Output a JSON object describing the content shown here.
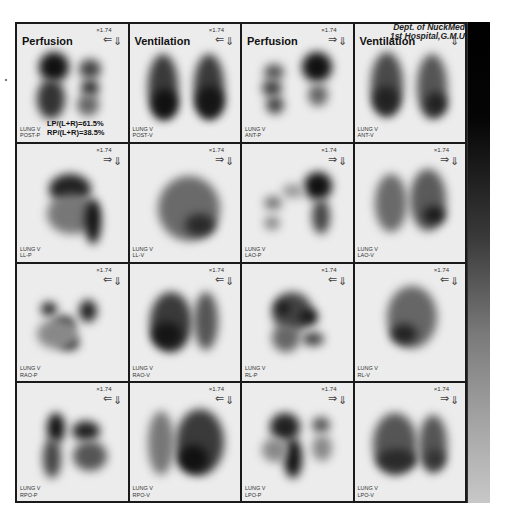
{
  "header": {
    "dept": "Dept. of NuckMed",
    "hospital": "1st Hospital,G.M.U"
  },
  "colorbar": {
    "top_color": "#000000",
    "bottom_color": "#c8c8c8"
  },
  "cells": [
    {
      "title": "Perfusion",
      "scale": "×1.74",
      "arrow_h": "⇐",
      "arrow_v": "⇓",
      "label_line1": "LUNG V",
      "label_line2": "POST-P",
      "ratio_lp": "LP/(L+R)=61.5%",
      "ratio_rp": "RP/(L+R)=38.5%"
    },
    {
      "title": "Ventilation",
      "scale": "×1.74",
      "arrow_h": "⇐",
      "arrow_v": "⇓",
      "label_line1": "LUNG V",
      "label_line2": "POST-V"
    },
    {
      "title": "Perfusion",
      "scale": "×1.74",
      "arrow_h": "⇒",
      "arrow_v": "⇓",
      "label_line1": "LUNG V",
      "label_line2": "ANT-P"
    },
    {
      "title": "Ventilation",
      "scale": "",
      "arrow_h": "",
      "arrow_v": "⇓",
      "label_line1": "LUNG V",
      "label_line2": "ANT-V"
    },
    {
      "scale": "×1.74",
      "arrow_h": "⇒",
      "arrow_v": "⇓",
      "label_line1": "LUNG V",
      "label_line2": "LL-P"
    },
    {
      "scale": "×1.74",
      "arrow_h": "⇒",
      "arrow_v": "⇓",
      "label_line1": "LUNG V",
      "label_line2": "LL-V"
    },
    {
      "scale": "×1.74",
      "arrow_h": "⇒",
      "arrow_v": "⇓",
      "label_line1": "LUNG V",
      "label_line2": "LAO-P"
    },
    {
      "scale": "×1.74",
      "arrow_h": "⇒",
      "arrow_v": "⇓",
      "label_line1": "LUNG V",
      "label_line2": "LAO-V"
    },
    {
      "scale": "×1.74",
      "arrow_h": "⇐",
      "arrow_v": "⇓",
      "label_line1": "LUNG V",
      "label_line2": "RAO-P"
    },
    {
      "scale": "×1.74",
      "arrow_h": "⇐",
      "arrow_v": "⇓",
      "label_line1": "LUNG V",
      "label_line2": "RAO-V"
    },
    {
      "scale": "×1.74",
      "arrow_h": "⇐",
      "arrow_v": "⇓",
      "label_line1": "LUNG V",
      "label_line2": "RL-P"
    },
    {
      "scale": "×1.74",
      "arrow_h": "⇐",
      "arrow_v": "⇓",
      "label_line1": "LUNG V",
      "label_line2": "RL-V"
    },
    {
      "scale": "×1.74",
      "arrow_h": "⇐",
      "arrow_v": "⇓",
      "label_line1": "LUNG V",
      "label_line2": "RPO-P"
    },
    {
      "scale": "×1.74",
      "arrow_h": "⇐",
      "arrow_v": "⇓",
      "label_line1": "LUNG V",
      "label_line2": "RPO-V"
    },
    {
      "scale": "×1.74",
      "arrow_h": "⇒",
      "arrow_v": "⇓",
      "label_line1": "LUNG V",
      "label_line2": "LPO-P"
    },
    {
      "scale": "×1.74",
      "arrow_h": "⇒",
      "arrow_v": "⇓",
      "label_line1": "LUNG V",
      "label_line2": "LPO-V"
    }
  ]
}
